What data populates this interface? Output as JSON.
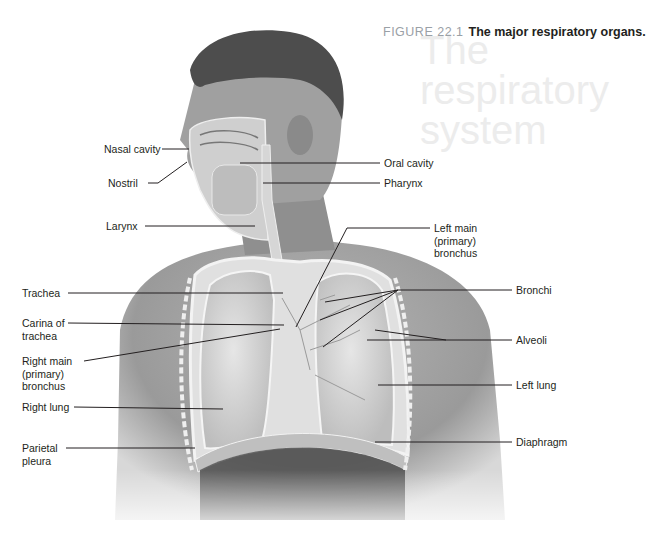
{
  "figure": {
    "number": "FIGURE 22.1",
    "title": "The major respiratory organs.",
    "background_ghost_text": [
      "The",
      "respiratory",
      "system"
    ]
  },
  "labels_left": [
    {
      "text": "Nasal cavity",
      "x": 104,
      "y": 143
    },
    {
      "text": "Nostril",
      "x": 104,
      "y": 178
    },
    {
      "text": "Larynx",
      "x": 104,
      "y": 221
    },
    {
      "text": "Trachea",
      "x": 22,
      "y": 287
    },
    {
      "text": "Carina of\ntrachea",
      "x": 22,
      "y": 317
    },
    {
      "text": "Right main\n(primary)\nbronchus",
      "x": 22,
      "y": 355
    },
    {
      "text": "Right lung",
      "x": 22,
      "y": 402
    },
    {
      "text": "Parietal\npleura",
      "x": 22,
      "y": 442
    }
  ],
  "labels_right": [
    {
      "text": "Oral cavity",
      "x": 384,
      "y": 157
    },
    {
      "text": "Pharynx",
      "x": 384,
      "y": 177
    },
    {
      "text": "Left main\n(primary)\nbronchus",
      "x": 434,
      "y": 222
    },
    {
      "text": "Bronchi",
      "x": 516,
      "y": 285
    },
    {
      "text": "Alveoli",
      "x": 516,
      "y": 335
    },
    {
      "text": "Left lung",
      "x": 516,
      "y": 380
    },
    {
      "text": "Diaphragm",
      "x": 516,
      "y": 437
    }
  ],
  "colors": {
    "text": "#231f20",
    "figure_number": "#9aa0a6",
    "skin_dark": "#6e6e6e",
    "skin_mid": "#a9a9a9",
    "skin_light": "#c8c8c8",
    "hair": "#4a4a4a",
    "lung": "#d9d9d9",
    "leader_line": "#231f20"
  }
}
